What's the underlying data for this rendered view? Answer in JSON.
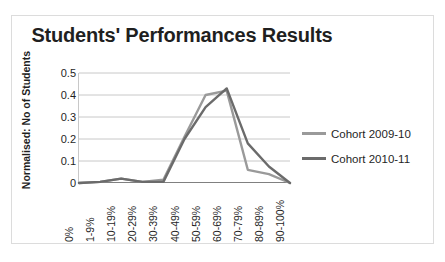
{
  "chart_data": {
    "type": "line",
    "title": "Students' Performances Results",
    "xlabel": "",
    "ylabel": "Normalised: No of Students",
    "categories": [
      "0%",
      "1-9%",
      "10-19%",
      "20-29%",
      "30-39%",
      "40-49%",
      "50-59%",
      "60-69%",
      "70-79%",
      "80-89%",
      "90-100%"
    ],
    "yticks": [
      "0.5",
      "0.4",
      "0.3",
      "0.2",
      "0.1",
      "0"
    ],
    "ylim": [
      0,
      0.5
    ],
    "grid": true,
    "legend_position": "right",
    "series": [
      {
        "name": "Cohort 2009-10",
        "color": "#9a9a9a",
        "values": [
          0.0,
          0.005,
          0.02,
          0.005,
          0.015,
          0.21,
          0.4,
          0.42,
          0.06,
          0.04,
          0.0
        ]
      },
      {
        "name": "Cohort 2010-11",
        "color": "#6b6b6b",
        "values": [
          0.0,
          0.005,
          0.02,
          0.005,
          0.005,
          0.2,
          0.345,
          0.43,
          0.18,
          0.075,
          0.0
        ]
      }
    ]
  }
}
